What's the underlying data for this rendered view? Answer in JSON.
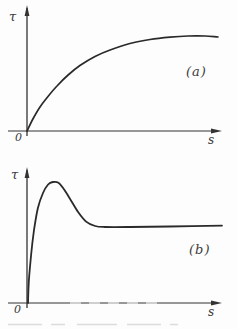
{
  "figure": {
    "panels": [
      {
        "id": "a",
        "label": "(a)",
        "y_axis_label": "τ",
        "x_axis_label": "s",
        "origin_label": "0"
      },
      {
        "id": "b",
        "label": "(b)",
        "y_axis_label": "τ",
        "x_axis_label": "s",
        "origin_label": "0"
      }
    ],
    "line_color": "#2a2a2a",
    "axis_color": "#333333"
  },
  "chart_data": [
    {
      "type": "line",
      "panel_label": "(a)",
      "title": "",
      "xlabel": "s",
      "ylabel": "τ",
      "origin_label": "0",
      "axis_numeric_ticks": false,
      "grid": false,
      "legend": false,
      "shape": "τ rises monotonically from the origin and saturates to a flat plateau",
      "xlim": [
        0,
        1
      ],
      "ylim": [
        0,
        1.3
      ],
      "x": [
        0,
        0.031,
        0.068,
        0.11,
        0.157,
        0.215,
        0.277,
        0.356,
        0.435,
        0.539,
        0.644,
        0.749,
        0.843,
        0.932,
        1.0
      ],
      "y": [
        0,
        0.126,
        0.253,
        0.363,
        0.474,
        0.589,
        0.689,
        0.784,
        0.853,
        0.921,
        0.963,
        0.987,
        1.0,
        1.0,
        0.989
      ]
    },
    {
      "type": "line",
      "panel_label": "(b)",
      "title": "",
      "xlabel": "s",
      "ylabel": "τ",
      "origin_label": "0",
      "axis_numeric_ticks": false,
      "grid": false,
      "legend": false,
      "shape": "τ rises almost vertically, overshoots to a peak, then relaxes to a constant plateau of about 0.63 of the peak value",
      "xlim": [
        0,
        1
      ],
      "ylim": [
        0,
        1.15
      ],
      "x": [
        0.005,
        0.01,
        0.021,
        0.036,
        0.056,
        0.082,
        0.108,
        0.133,
        0.159,
        0.185,
        0.221,
        0.262,
        0.303,
        0.349,
        0.4,
        0.528,
        0.733,
        1.0
      ],
      "y": [
        0,
        0.19,
        0.397,
        0.603,
        0.785,
        0.909,
        0.979,
        1.0,
        0.996,
        0.95,
        0.86,
        0.752,
        0.673,
        0.636,
        0.628,
        0.628,
        0.632,
        0.64
      ]
    }
  ]
}
